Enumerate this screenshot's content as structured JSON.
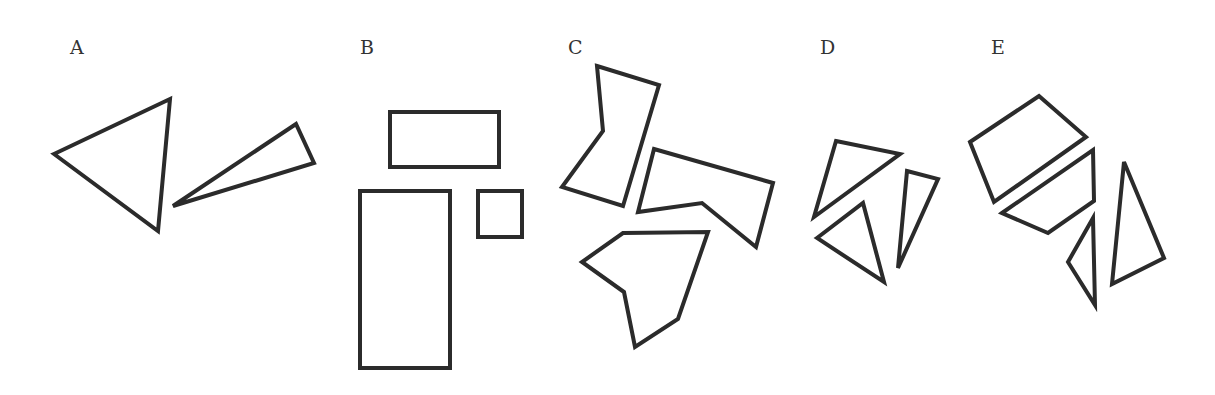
{
  "diagram": {
    "stroke_color": "#2b2b2b",
    "label_color": "#333333",
    "options": [
      {
        "label": "A",
        "pieces": [
          {
            "type": "triangle"
          },
          {
            "type": "thin-triangle"
          }
        ]
      },
      {
        "label": "B",
        "pieces": [
          {
            "type": "wide-rectangle"
          },
          {
            "type": "tall-rectangle"
          },
          {
            "type": "square"
          }
        ]
      },
      {
        "label": "C",
        "pieces": [
          {
            "type": "pentagon"
          },
          {
            "type": "pentagon"
          },
          {
            "type": "hexagon"
          }
        ]
      },
      {
        "label": "D",
        "pieces": [
          {
            "type": "triangle"
          },
          {
            "type": "triangle"
          },
          {
            "type": "thin-triangle"
          }
        ]
      },
      {
        "label": "E",
        "pieces": [
          {
            "type": "quadrilateral"
          },
          {
            "type": "quadrilateral"
          },
          {
            "type": "small-triangle"
          },
          {
            "type": "triangle"
          }
        ]
      }
    ]
  }
}
